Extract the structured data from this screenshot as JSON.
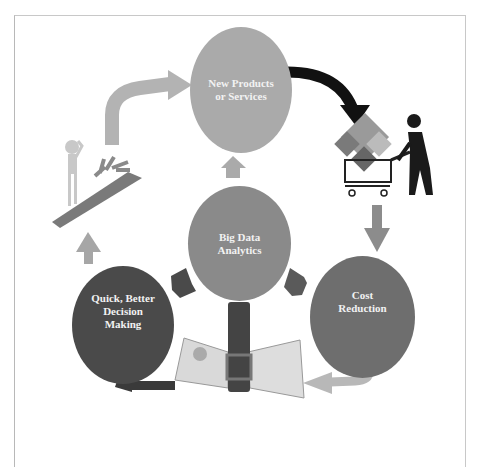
{
  "diagram": {
    "center": {
      "label": "Big Data\nAnalytics",
      "color": "#8a8a8a"
    },
    "nodes": [
      {
        "id": "new-products",
        "label": "New Products\nor Services",
        "color": "#aaaaaa"
      },
      {
        "id": "cost-reduction",
        "label": "Cost\nReduction",
        "color": "#6e6e6e"
      },
      {
        "id": "decision-making",
        "label": "Quick, Better\nDecision\nMaking",
        "color": "#4a4a4a"
      }
    ],
    "images": [
      {
        "id": "shopping-cart-person",
        "description": "person pushing shopping cart full of product icons"
      },
      {
        "id": "money-belt",
        "description": "stack of dollar bills squeezed by a belt"
      },
      {
        "id": "decision-figure",
        "description": "figure scratching head at path with branching arrows"
      }
    ],
    "flow": [
      "Big Data Analytics",
      "New Products or Services",
      "Cost Reduction",
      "Quick, Better Decision Making",
      "New Products or Services"
    ],
    "colors": {
      "arrow_light": "#b3b3b3",
      "arrow_dark": "#1a1a1a",
      "arrow_mid": "#555555",
      "frame": "#c0c0c0"
    }
  }
}
